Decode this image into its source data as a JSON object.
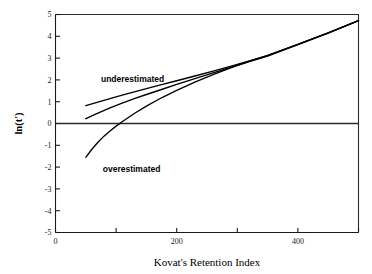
{
  "chart_data": {
    "type": "line",
    "title": "",
    "xlabel": "Kovat's Retention Index",
    "ylabel": "ln(t')",
    "xlim": [
      0,
      500
    ],
    "ylim": [
      -5,
      5
    ],
    "grid": false,
    "legend": "none",
    "x_ticks": [
      0,
      100,
      200,
      300,
      400,
      500
    ],
    "x_tick_labels": [
      "0",
      "",
      "200",
      "",
      "400",
      ""
    ],
    "y_ticks": [
      -5,
      -4,
      -3,
      -2,
      -1,
      0,
      1,
      2,
      3,
      4,
      5
    ],
    "y_tick_labels": [
      "-5",
      "-4",
      "-3",
      "-2",
      "-1",
      "0",
      "1",
      "2",
      "3",
      "4",
      "5"
    ],
    "zero_line": 0,
    "annotations": [
      {
        "text": "underestimated",
        "x": 75,
        "y": 2.05
      },
      {
        "text": "overestimated",
        "x": 78,
        "y": -2.1
      }
    ],
    "series": [
      {
        "name": "upper-curve",
        "x": [
          50,
          70,
          90,
          110,
          130,
          150,
          175,
          200,
          230,
          260,
          290,
          320,
          350,
          400,
          450,
          500
        ],
        "values": [
          0.82,
          0.98,
          1.14,
          1.3,
          1.45,
          1.6,
          1.78,
          1.96,
          2.18,
          2.4,
          2.63,
          2.87,
          3.11,
          3.63,
          4.16,
          4.72
        ]
      },
      {
        "name": "middle-curve",
        "x": [
          50,
          70,
          90,
          110,
          130,
          150,
          175,
          200,
          230,
          260,
          290,
          320,
          350,
          400,
          450,
          500
        ],
        "values": [
          0.22,
          0.48,
          0.72,
          0.93,
          1.14,
          1.33,
          1.56,
          1.79,
          2.06,
          2.32,
          2.58,
          2.84,
          3.09,
          3.62,
          4.15,
          4.72
        ]
      },
      {
        "name": "lower-curve",
        "x": [
          50,
          60,
          70,
          80,
          90,
          100,
          110,
          130,
          150,
          175,
          200,
          230,
          260,
          290,
          320,
          350,
          400,
          450,
          500
        ],
        "values": [
          -1.55,
          -1.18,
          -0.86,
          -0.58,
          -0.34,
          -0.12,
          0.08,
          0.46,
          0.8,
          1.18,
          1.52,
          1.9,
          2.24,
          2.56,
          2.86,
          3.12,
          3.63,
          4.16,
          4.72
        ]
      }
    ]
  }
}
